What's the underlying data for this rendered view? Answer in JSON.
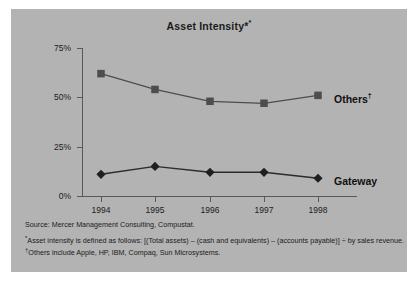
{
  "figure": {
    "title": "Asset Intensity",
    "title_marker": "*",
    "source_line": "Source: Mercer Management Consulting,  Compustat.",
    "footnotes": [
      {
        "marker": "*",
        "text": "Asset intensity is defined as follows: [(Total assets) – (cash and equivalents) – (accounts payable)] ÷ by sales revenue."
      },
      {
        "marker": "†",
        "text": "Others include Apple, HP, IBM, Compaq, Sun Microsystems."
      }
    ],
    "panel_color": "#b3b3b3",
    "series_color": "#4d4d4d",
    "axis_color": "#595959"
  },
  "chart_data": {
    "type": "line",
    "title": "Asset Intensity*",
    "xlabel": "",
    "ylabel": "",
    "categories": [
      "1994",
      "1995",
      "1996",
      "1997",
      "1998"
    ],
    "ytick_labels": [
      "0%",
      "25%",
      "50%",
      "75%"
    ],
    "ytick_values": [
      0,
      25,
      50,
      75
    ],
    "ylim": [
      0,
      75
    ],
    "grid": false,
    "legend_position": "right-inline",
    "series": [
      {
        "name": "Others",
        "label": "Others",
        "label_marker": "†",
        "marker": "square",
        "values": [
          62,
          54,
          48,
          47,
          51
        ]
      },
      {
        "name": "Gateway",
        "label": "Gateway",
        "label_marker": "",
        "marker": "diamond",
        "values": [
          11,
          15,
          12,
          12,
          9
        ]
      }
    ]
  }
}
